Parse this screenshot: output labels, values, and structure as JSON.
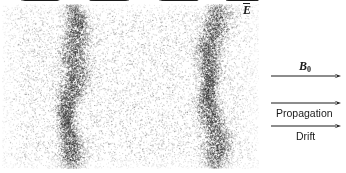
{
  "figure": {
    "type": "plasma-wave-diagram",
    "width": 346,
    "height": 173,
    "background_color": "#ffffff",
    "ink_color": "#1a1a1a"
  },
  "speckle_field": {
    "description": "grayscale particle density field representing plasma electrons",
    "x": 2,
    "y": 4,
    "width": 256,
    "height": 164,
    "base_particle_count": 9000,
    "base_opacity": 0.3,
    "bunch_particle_count": 5200,
    "bunch_opacity": 0.62,
    "bunch_centers": [
      72,
      212
    ],
    "bunch_sigma": 13,
    "dot_size": 1,
    "color": "#2b2b2b"
  },
  "field_arrows": {
    "description": "E-field arrows converging on each charge bunch",
    "row_start_y": 15,
    "row_spacing": 22.2,
    "row_count": 7,
    "stroke_color": "#1a1a1a",
    "stroke_width": 1.2,
    "head_length": 6,
    "head_width": 4.2,
    "groups": [
      {
        "name": "bunch-1-left-arrows",
        "direction": "right",
        "x_tail": 24,
        "x_tip": 62,
        "jitter": 3
      },
      {
        "name": "bunch-1-right-arrows",
        "direction": "left",
        "x_tail": 128,
        "x_tip": 88,
        "jitter": 3
      },
      {
        "name": "bunch-2-left-arrows",
        "direction": "right",
        "x_tail": 162,
        "x_tip": 200,
        "jitter": 3
      },
      {
        "name": "bunch-2-right-arrows",
        "direction": "left",
        "x_tail": 256,
        "x_tip": 224,
        "jitter": 3
      }
    ]
  },
  "annotations": {
    "e_field": {
      "label": "E",
      "notation": "vector-overbar",
      "x": 243,
      "y": 3
    },
    "side_arrows": [
      {
        "name": "b0-arrow",
        "label": "B",
        "subscript": "0",
        "style": "serif-italic",
        "label_position": "above",
        "label_x": 299,
        "label_y": 60,
        "arrow_y": 76,
        "x_tail": 271,
        "x_tip": 341
      },
      {
        "name": "propagation-arrow",
        "label": "Propagation",
        "style": "sans",
        "label_position": "below",
        "label_x": 276,
        "label_y": 108,
        "arrow_y": 103,
        "x_tail": 271,
        "x_tip": 341
      },
      {
        "name": "drift-arrow",
        "label": "Drift",
        "style": "sans",
        "label_position": "below",
        "label_x": 296,
        "label_y": 131,
        "arrow_y": 126,
        "x_tail": 271,
        "x_tip": 341
      }
    ]
  }
}
